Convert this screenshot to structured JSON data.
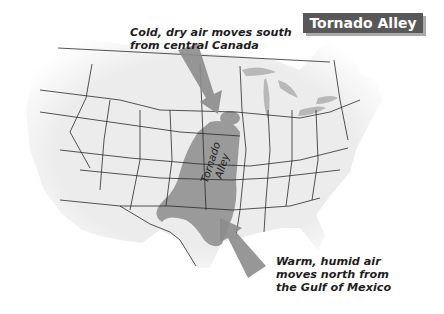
{
  "title": "Tornado Alley",
  "captions": {
    "cold_air_line1": "Cold, dry air moves south",
    "cold_air_line2": "from central Canada",
    "warm_air_line1": "Warm, humid air",
    "warm_air_line2": "moves north from",
    "warm_air_line3": "the Gulf of Mexico"
  },
  "region_label": {
    "line1": "Tornado",
    "line2": "Alley"
  },
  "colors": {
    "title_bg": "#585858",
    "land": "#f2f2f2",
    "tornado_region": "#9a9a9a",
    "arrow": "#8c8c8c",
    "lakes": "#b5b5b5",
    "borders": "#2a2a2a"
  }
}
